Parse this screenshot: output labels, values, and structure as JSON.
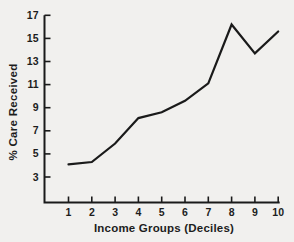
{
  "chart_data": {
    "type": "line",
    "title": "",
    "xlabel": "Income Groups (Deciles)",
    "ylabel": "% Care Received",
    "x": [
      1,
      2,
      3,
      4,
      5,
      6,
      7,
      8,
      9,
      10
    ],
    "values": [
      4.1,
      4.3,
      5.9,
      8.1,
      8.6,
      9.6,
      11.1,
      16.2,
      13.7,
      15.6
    ],
    "xticks": [
      "1",
      "2",
      "3",
      "4",
      "5",
      "6",
      "7",
      "8",
      "9",
      "10"
    ],
    "yticks": [
      "3",
      "5",
      "7",
      "9",
      "11",
      "13",
      "15",
      "17"
    ],
    "ytick_values": [
      3,
      5,
      7,
      9,
      11,
      13,
      15,
      17
    ],
    "xlim": [
      1,
      10
    ],
    "ylim": [
      3,
      17
    ],
    "grid": false,
    "legend": null,
    "line_color": "#1a1a1a",
    "axis_color": "#1a1a1a",
    "text_color": "#1d1d1d",
    "background_color": "#f1f0ee"
  }
}
